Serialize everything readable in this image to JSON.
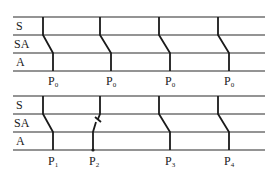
{
  "colors": {
    "line": "#2a2a2a",
    "text": "#1a1a1a",
    "background": "#ffffff"
  },
  "top_diagram": {
    "row_labels": [
      "S",
      "SA",
      "A"
    ],
    "points": [
      {
        "label": "P",
        "sub": "0"
      },
      {
        "label": "P",
        "sub": "0"
      },
      {
        "label": "P",
        "sub": "0"
      },
      {
        "label": "P",
        "sub": "0"
      }
    ]
  },
  "bottom_diagram": {
    "row_labels": [
      "S",
      "SA",
      "A"
    ],
    "points": [
      {
        "label": "P",
        "sub": "1"
      },
      {
        "label": "P",
        "sub": "2"
      },
      {
        "label": "P",
        "sub": "3"
      },
      {
        "label": "P",
        "sub": "4"
      }
    ]
  }
}
